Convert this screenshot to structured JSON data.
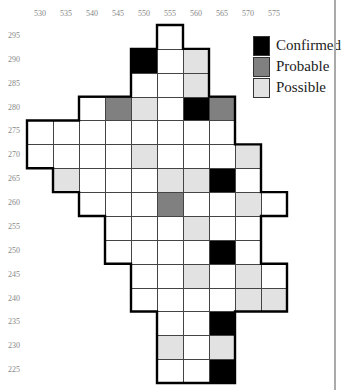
{
  "x_labels": [
    "530",
    "535",
    "540",
    "545",
    "550",
    "555",
    "560",
    "565",
    "570",
    "575"
  ],
  "y_labels": [
    "295",
    "290",
    "285",
    "280",
    "275",
    "270",
    "265",
    "260",
    "255",
    "250",
    "245",
    "240",
    "235",
    "230",
    "225"
  ],
  "legend": [
    {
      "key": "C",
      "label": "Confirmed",
      "color": "#000000"
    },
    {
      "key": "B",
      "label": "Probable",
      "color": "#808080"
    },
    {
      "key": "P",
      "label": "Possible",
      "color": "#e2e2e2"
    }
  ],
  "grid": {
    "295": {
      "555": "W"
    },
    "290": {
      "550": "C",
      "555": "W",
      "560": "P"
    },
    "285": {
      "550": "W",
      "555": "W",
      "560": "P"
    },
    "280": {
      "540": "W",
      "545": "B",
      "550": "P",
      "555": "W",
      "560": "C",
      "565": "B"
    },
    "275": {
      "530": "W",
      "535": "W",
      "540": "W",
      "545": "W",
      "550": "W",
      "555": "W",
      "560": "W",
      "565": "W"
    },
    "270": {
      "530": "W",
      "535": "W",
      "540": "W",
      "545": "W",
      "550": "P",
      "555": "W",
      "560": "W",
      "565": "W",
      "570": "P"
    },
    "265": {
      "535": "P",
      "540": "W",
      "545": "W",
      "550": "W",
      "555": "P",
      "560": "P",
      "565": "C",
      "570": "W"
    },
    "260": {
      "540": "W",
      "545": "W",
      "550": "W",
      "555": "B",
      "560": "W",
      "565": "W",
      "570": "P",
      "575": "W"
    },
    "255": {
      "545": "W",
      "550": "W",
      "555": "W",
      "560": "P",
      "565": "W",
      "570": "W"
    },
    "250": {
      "545": "W",
      "550": "W",
      "555": "W",
      "560": "W",
      "565": "C",
      "570": "W"
    },
    "245": {
      "550": "W",
      "555": "W",
      "560": "P",
      "565": "W",
      "570": "P",
      "575": "W"
    },
    "240": {
      "550": "W",
      "555": "W",
      "560": "W",
      "565": "W",
      "570": "P",
      "575": "P"
    },
    "235": {
      "555": "W",
      "560": "W",
      "565": "C"
    },
    "230": {
      "555": "P",
      "560": "W",
      "565": "P"
    },
    "225": {
      "555": "W",
      "560": "W",
      "565": "C"
    }
  },
  "colors": {
    "W": "#ffffff",
    "C": "#000000",
    "B": "#808080",
    "P": "#e2e2e2"
  }
}
